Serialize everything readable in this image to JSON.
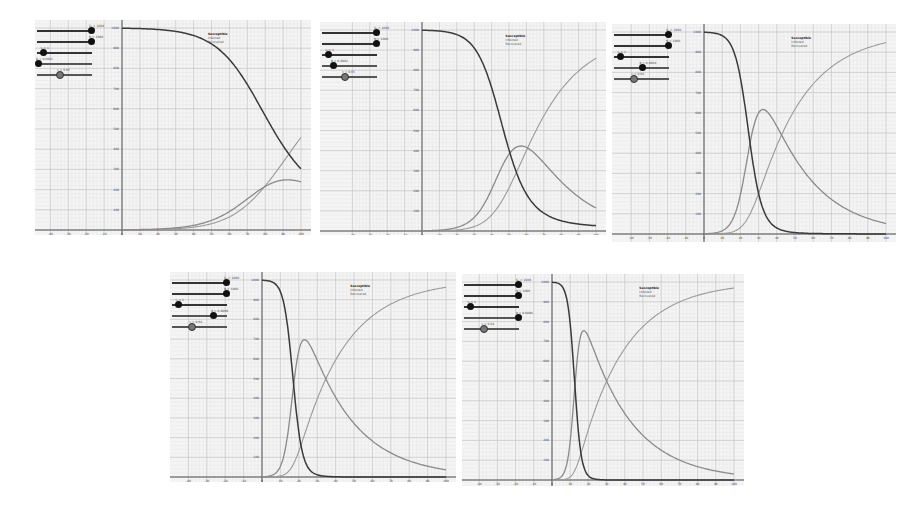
{
  "figure": {
    "legend": [
      "Susceptible",
      "Infected",
      "Recovered"
    ],
    "colors": {
      "susceptible": "#3a3a3a",
      "infected": "#8a8a8a",
      "recovered": "#9a9a9a",
      "grid_major": "#c8c8c8",
      "grid_minor": "#e2e2e2",
      "background": "#f4f4f4"
    }
  },
  "chart_data": [
    {
      "type": "line",
      "title": "SIR model panel 1",
      "sliders": [
        {
          "label": "S₀ = 1000",
          "pos": 0.98
        },
        {
          "label": "N = 1000",
          "pos": 0.98
        },
        {
          "label": "I₀ = 1",
          "pos": 0.1
        },
        {
          "label": "β = 0.0001",
          "pos": 0.02
        },
        {
          "label": "γ = 0.05",
          "pos": 0.4
        }
      ],
      "params": {
        "N": 1000,
        "I0": 1,
        "beta": 0.00013,
        "gamma": 0.05
      },
      "xlim": [
        -40,
        100
      ],
      "ylim": [
        0,
        1000
      ],
      "x_ticks": [
        -40,
        -30,
        -20,
        -10,
        0,
        10,
        20,
        30,
        40,
        50,
        60,
        70,
        80,
        90,
        100
      ],
      "y_ticks": [
        100,
        200,
        300,
        400,
        500,
        600,
        700,
        800,
        900,
        1000
      ],
      "series": [
        {
          "name": "Susceptible",
          "description": "decreases from 1000 to ~170 at t=100"
        },
        {
          "name": "Infected",
          "description": "rises to peak ~300 near t=85"
        },
        {
          "name": "Recovered",
          "description": "rises to ~550 at t=100"
        }
      ],
      "legend_position": "upper right"
    },
    {
      "type": "line",
      "title": "SIR model panel 2",
      "sliders": [
        {
          "label": "S₀ = 1000",
          "pos": 0.98
        },
        {
          "label": "N = 1000",
          "pos": 0.98
        },
        {
          "label": "I₀ = 1",
          "pos": 0.1
        },
        {
          "label": "β = 0.0002",
          "pos": 0.2
        },
        {
          "label": "γ = 0.05",
          "pos": 0.4
        }
      ],
      "params": {
        "N": 1000,
        "I0": 1,
        "beta": 0.00019,
        "gamma": 0.045
      },
      "xlim": [
        -40,
        100
      ],
      "ylim": [
        0,
        1000
      ],
      "x_ticks": [
        -40,
        -30,
        -20,
        -10,
        0,
        10,
        20,
        30,
        40,
        50,
        60,
        70,
        80,
        90,
        100
      ],
      "y_ticks": [
        100,
        200,
        300,
        400,
        500,
        600,
        700,
        800,
        900,
        1000
      ],
      "series": [
        {
          "name": "Susceptible",
          "description": "S-curve drops through 500 near t=40"
        },
        {
          "name": "Infected",
          "description": "peak ~470 near t=47"
        },
        {
          "name": "Recovered",
          "description": "rises to ~880 at t=100"
        }
      ],
      "legend_position": "upper right"
    },
    {
      "type": "line",
      "title": "SIR model panel 3",
      "sliders": [
        {
          "label": "S₀ = 1000",
          "pos": 0.98
        },
        {
          "label": "N = 1000",
          "pos": 0.98
        },
        {
          "label": "I₀ = 1",
          "pos": 0.1
        },
        {
          "label": "β = 0.0004",
          "pos": 0.5
        },
        {
          "label": "γ = 0.04",
          "pos": 0.35
        }
      ],
      "params": {
        "N": 1000,
        "I0": 1,
        "beta": 0.00032,
        "gamma": 0.04
      },
      "xlim": [
        -40,
        100
      ],
      "ylim": [
        0,
        1000
      ],
      "x_ticks": [
        -40,
        -30,
        -20,
        -10,
        0,
        10,
        20,
        30,
        40,
        50,
        60,
        70,
        80,
        90,
        100
      ],
      "y_ticks": [
        100,
        200,
        300,
        400,
        500,
        600,
        700,
        800,
        900,
        1000
      ],
      "series": [
        {
          "name": "Susceptible",
          "description": "sharp drop near t=22"
        },
        {
          "name": "Infected",
          "description": "peak ~600 near t=30"
        },
        {
          "name": "Recovered",
          "description": "rises to ~950 at t=100"
        }
      ],
      "legend_position": "upper right"
    },
    {
      "type": "line",
      "title": "SIR model panel 4",
      "sliders": [
        {
          "label": "S₀ = 1000",
          "pos": 0.98
        },
        {
          "label": "N = 1000",
          "pos": 0.98
        },
        {
          "label": "I₀ = 1",
          "pos": 0.1
        },
        {
          "label": "β = 0.0006",
          "pos": 0.75
        },
        {
          "label": "γ = 0.04",
          "pos": 0.35
        }
      ],
      "params": {
        "N": 1000,
        "I0": 1,
        "beta": 0.00045,
        "gamma": 0.04
      },
      "xlim": [
        -40,
        100
      ],
      "ylim": [
        0,
        1000
      ],
      "x_ticks": [
        -40,
        -30,
        -20,
        -10,
        0,
        10,
        20,
        30,
        40,
        50,
        60,
        70,
        80,
        90,
        100
      ],
      "y_ticks": [
        100,
        200,
        300,
        400,
        500,
        600,
        700,
        800,
        900,
        1000
      ],
      "series": [
        {
          "name": "Susceptible",
          "description": "sharp drop near t=17"
        },
        {
          "name": "Infected",
          "description": "peak ~670 near t=23"
        },
        {
          "name": "Recovered",
          "description": "rises to ~970 at t=100"
        }
      ],
      "legend_position": "upper right"
    },
    {
      "type": "line",
      "title": "SIR model panel 5",
      "sliders": [
        {
          "label": "S₀ = 1000",
          "pos": 0.98
        },
        {
          "label": "N = 1000",
          "pos": 0.98
        },
        {
          "label": "I₀ = 1",
          "pos": 0.1
        },
        {
          "label": "β = 0.0008",
          "pos": 0.98
        },
        {
          "label": "γ = 0.04",
          "pos": 0.35
        }
      ],
      "params": {
        "N": 1000,
        "I0": 1,
        "beta": 0.0006,
        "gamma": 0.04
      },
      "xlim": [
        -40,
        100
      ],
      "ylim": [
        0,
        1000
      ],
      "x_ticks": [
        -40,
        -30,
        -20,
        -10,
        0,
        10,
        20,
        30,
        40,
        50,
        60,
        70,
        80,
        90,
        100
      ],
      "y_ticks": [
        100,
        200,
        300,
        400,
        500,
        600,
        700,
        800,
        900,
        1000
      ],
      "series": [
        {
          "name": "Susceptible",
          "description": "very sharp drop near t=14"
        },
        {
          "name": "Infected",
          "description": "peak ~710 near t=19"
        },
        {
          "name": "Recovered",
          "description": "rises to ~970 at t=100"
        }
      ],
      "legend_position": "upper right"
    }
  ]
}
